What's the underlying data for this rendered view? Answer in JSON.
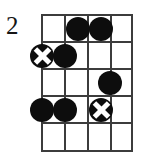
{
  "diagram": {
    "type": "guitar-chord-diagram",
    "starting_fret_label": "2",
    "geometry": {
      "grid_left": 42,
      "grid_right": 132,
      "grid_top": 15,
      "grid_bottom": 151,
      "string_count": 5,
      "fret_count": 5,
      "string_x": [
        42,
        65,
        88,
        111,
        132
      ],
      "fret_y": [
        15,
        42,
        69,
        96,
        123,
        151
      ]
    },
    "markers": [
      {
        "name": "marker-fret1-string3",
        "style": "filled",
        "x": 78,
        "y": 29
      },
      {
        "name": "marker-fret1-string4",
        "style": "filled",
        "x": 101,
        "y": 29
      },
      {
        "name": "marker-fret2-string1",
        "style": "crossed",
        "x": 42,
        "y": 56
      },
      {
        "name": "marker-fret2-string2",
        "style": "filled",
        "x": 65,
        "y": 56
      },
      {
        "name": "marker-fret3-string4",
        "style": "filled",
        "x": 110,
        "y": 83
      },
      {
        "name": "marker-fret4-string1",
        "style": "filled",
        "x": 42,
        "y": 110
      },
      {
        "name": "marker-fret4-string2",
        "style": "filled",
        "x": 65,
        "y": 110
      },
      {
        "name": "marker-fret4-string4",
        "style": "crossed",
        "x": 101,
        "y": 110
      }
    ],
    "colors": {
      "grid": "#3c3c3c",
      "marker_fill": "#0d0d0d",
      "marker_cross": "#ffffff",
      "background": "#ffffff",
      "label": "#151515"
    }
  }
}
